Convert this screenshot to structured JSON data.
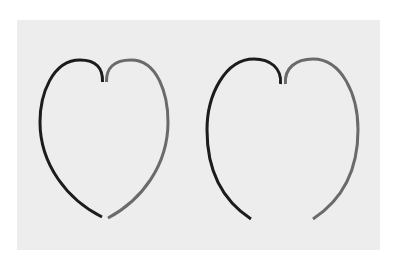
{
  "figure": {
    "background_color": "#ffffff",
    "panel_color": "#ededed",
    "left_stroke_color": "#1c1c1c",
    "right_stroke_color": "#6a6a6a",
    "stroke_width": 3,
    "shapes": [
      {
        "name": "closed-heart",
        "bottom": "joined"
      },
      {
        "name": "open-heart",
        "bottom": "open"
      }
    ]
  }
}
